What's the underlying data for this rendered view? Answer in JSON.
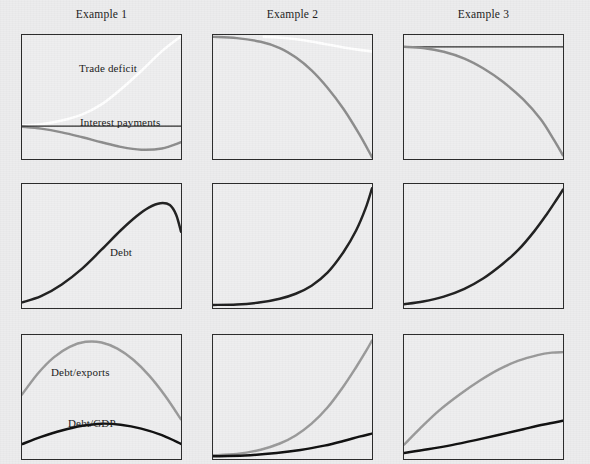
{
  "figure": {
    "background_color": "#ececed",
    "panel_background_color": "#eeeeef",
    "panel_border_color": "#2b2b2b",
    "columns": [
      {
        "header": "Example 1"
      },
      {
        "header": "Example 2"
      },
      {
        "header": "Example 3"
      }
    ],
    "series_colors": {
      "trade_deficit": "#ffffff",
      "interest_payments": "#8d8d8d",
      "debt": "#202020",
      "debt_exports": "#9a9a9a",
      "debt_gdp": "#101010"
    },
    "labels": {
      "trade_deficit": "Trade deficit",
      "interest_payments": "Interest payments",
      "debt": "Debt",
      "debt_exports": "Debt/exports",
      "debt_gdp": "Debt/GDP"
    }
  },
  "chart_data": {
    "type": "line",
    "title": "",
    "xlabel": "",
    "ylabel": "",
    "grid": false,
    "legend_position": "inline-annotations",
    "axis_ranges": {
      "x": [
        0,
        1
      ],
      "y": [
        0,
        1
      ]
    },
    "panel_grid": {
      "rows": 3,
      "cols": 3
    },
    "column_headers": [
      "Example 1",
      "Example 2",
      "Example 3"
    ],
    "row_topics": [
      "Trade deficit & interest payments",
      "Debt",
      "Debt ratios"
    ],
    "panels": [
      {
        "row": 1,
        "col": 1,
        "column_header": "Example 1",
        "annotations": [
          "Trade deficit",
          "Interest payments"
        ],
        "series": [
          {
            "name": "Trade deficit",
            "color": "#ffffff",
            "x": [
              0.0,
              0.12,
              0.25,
              0.38,
              0.5,
              0.62,
              0.75,
              0.88,
              1.0
            ],
            "y": [
              0.27,
              0.28,
              0.31,
              0.36,
              0.44,
              0.56,
              0.71,
              0.87,
              0.99
            ]
          },
          {
            "name": "Interest payments",
            "color": "#8d8d8d",
            "x": [
              0.0,
              0.12,
              0.25,
              0.38,
              0.5,
              0.62,
              0.75,
              0.88,
              1.0
            ],
            "y": [
              0.26,
              0.245,
              0.215,
              0.175,
              0.135,
              0.098,
              0.075,
              0.085,
              0.135
            ]
          },
          {
            "name": "Zero line",
            "color": "#2b2b2b",
            "x": [
              0.0,
              1.0
            ],
            "y": [
              0.265,
              0.265
            ]
          }
        ]
      },
      {
        "row": 1,
        "col": 2,
        "column_header": "Example 2",
        "annotations": [],
        "series": [
          {
            "name": "Trade deficit",
            "color": "#ffffff",
            "x": [
              0.32,
              0.45,
              0.58,
              0.7,
              0.82,
              0.92,
              1.0
            ],
            "y": [
              0.985,
              0.975,
              0.955,
              0.928,
              0.9,
              0.88,
              0.868
            ]
          },
          {
            "name": "Interest payments",
            "color": "#8d8d8d",
            "x": [
              0.0,
              0.15,
              0.3,
              0.42,
              0.52,
              0.62,
              0.72,
              0.82,
              0.92,
              1.0
            ],
            "y": [
              0.985,
              0.975,
              0.945,
              0.895,
              0.82,
              0.715,
              0.575,
              0.405,
              0.2,
              0.015
            ]
          }
        ]
      },
      {
        "row": 1,
        "col": 3,
        "column_header": "Example 3",
        "annotations": [],
        "series": [
          {
            "name": "Trade deficit",
            "color": "#2b2b2b",
            "x": [
              0.0,
              1.0
            ],
            "y": [
              0.905,
              0.905
            ]
          },
          {
            "name": "Interest payments",
            "color": "#8d8d8d",
            "x": [
              0.0,
              0.12,
              0.25,
              0.38,
              0.5,
              0.62,
              0.75,
              0.86,
              0.94,
              1.0
            ],
            "y": [
              0.905,
              0.895,
              0.865,
              0.81,
              0.73,
              0.625,
              0.48,
              0.32,
              0.16,
              0.03
            ]
          }
        ]
      },
      {
        "row": 2,
        "col": 1,
        "column_header": "Example 1",
        "annotations": [
          "Debt"
        ],
        "series": [
          {
            "name": "Debt",
            "color": "#202020",
            "x": [
              0.0,
              0.12,
              0.25,
              0.38,
              0.5,
              0.62,
              0.72,
              0.8,
              0.87,
              0.93,
              0.97,
              1.0
            ],
            "y": [
              0.045,
              0.095,
              0.19,
              0.32,
              0.47,
              0.625,
              0.74,
              0.812,
              0.845,
              0.83,
              0.75,
              0.615
            ]
          }
        ]
      },
      {
        "row": 2,
        "col": 2,
        "column_header": "Example 2",
        "annotations": [],
        "series": [
          {
            "name": "Debt",
            "color": "#202020",
            "x": [
              0.0,
              0.15,
              0.3,
              0.42,
              0.52,
              0.62,
              0.72,
              0.82,
              0.9,
              0.96,
              1.0
            ],
            "y": [
              0.025,
              0.028,
              0.046,
              0.075,
              0.115,
              0.18,
              0.285,
              0.45,
              0.625,
              0.805,
              0.965
            ]
          }
        ]
      },
      {
        "row": 2,
        "col": 3,
        "column_header": "Example 3",
        "annotations": [],
        "series": [
          {
            "name": "Debt",
            "color": "#202020",
            "x": [
              0.0,
              0.12,
              0.25,
              0.38,
              0.5,
              0.62,
              0.72,
              0.82,
              0.9,
              0.96,
              1.0
            ],
            "y": [
              0.03,
              0.052,
              0.092,
              0.155,
              0.24,
              0.355,
              0.47,
              0.62,
              0.76,
              0.875,
              0.955
            ]
          }
        ]
      },
      {
        "row": 3,
        "col": 1,
        "column_header": "Example 1",
        "annotations": [
          "Debt/exports",
          "Debt/GDP"
        ],
        "series": [
          {
            "name": "Debt/exports",
            "color": "#9a9a9a",
            "x": [
              0.0,
              0.1,
              0.2,
              0.3,
              0.4,
              0.5,
              0.6,
              0.7,
              0.8,
              0.9,
              1.0
            ],
            "y": [
              0.52,
              0.69,
              0.82,
              0.905,
              0.945,
              0.94,
              0.89,
              0.8,
              0.672,
              0.51,
              0.32
            ]
          },
          {
            "name": "Debt/GDP",
            "color": "#101010",
            "x": [
              0.0,
              0.12,
              0.25,
              0.38,
              0.5,
              0.62,
              0.75,
              0.88,
              1.0
            ],
            "y": [
              0.12,
              0.178,
              0.23,
              0.268,
              0.285,
              0.276,
              0.245,
              0.192,
              0.122
            ]
          }
        ]
      },
      {
        "row": 3,
        "col": 2,
        "column_header": "Example 2",
        "annotations": [],
        "series": [
          {
            "name": "Debt/exports",
            "color": "#9a9a9a",
            "x": [
              0.0,
              0.15,
              0.3,
              0.42,
              0.52,
              0.62,
              0.72,
              0.82,
              0.9,
              0.96,
              1.0
            ],
            "y": [
              0.03,
              0.04,
              0.075,
              0.125,
              0.19,
              0.285,
              0.415,
              0.585,
              0.74,
              0.865,
              0.955
            ]
          },
          {
            "name": "Debt/GDP",
            "color": "#101010",
            "x": [
              0.0,
              0.2,
              0.4,
              0.55,
              0.7,
              0.82,
              0.92,
              1.0
            ],
            "y": [
              0.022,
              0.028,
              0.048,
              0.072,
              0.108,
              0.145,
              0.18,
              0.205
            ]
          }
        ]
      },
      {
        "row": 3,
        "col": 3,
        "column_header": "Example 3",
        "annotations": [],
        "series": [
          {
            "name": "Debt/exports",
            "color": "#9a9a9a",
            "x": [
              0.0,
              0.1,
              0.22,
              0.35,
              0.48,
              0.6,
              0.72,
              0.84,
              0.93,
              1.0
            ],
            "y": [
              0.115,
              0.245,
              0.39,
              0.52,
              0.635,
              0.725,
              0.793,
              0.838,
              0.858,
              0.862
            ]
          },
          {
            "name": "Debt/GDP",
            "color": "#101010",
            "x": [
              0.0,
              0.15,
              0.3,
              0.45,
              0.6,
              0.75,
              0.88,
              1.0
            ],
            "y": [
              0.048,
              0.078,
              0.112,
              0.152,
              0.195,
              0.24,
              0.278,
              0.308
            ]
          }
        ]
      }
    ]
  },
  "geometry": {
    "panel_width": 161,
    "panel_height": 126,
    "col_x": [
      21,
      212,
      403
    ],
    "row_y": [
      34,
      183,
      334
    ],
    "header_y": 8
  }
}
